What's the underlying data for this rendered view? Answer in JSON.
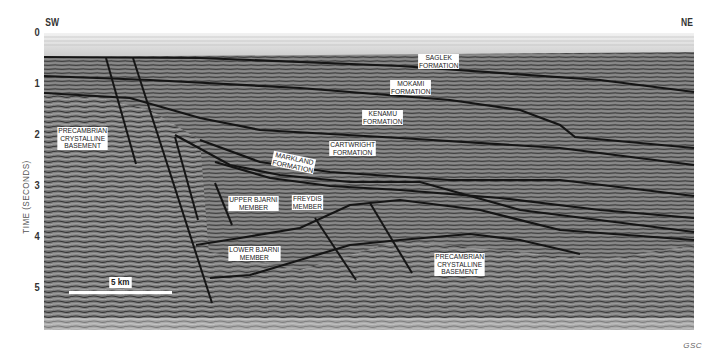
{
  "figure": {
    "type": "seismic reflection profile",
    "orientation": {
      "left": "SW",
      "right": "NE"
    },
    "credit": "GSC"
  },
  "axis": {
    "title": "TIME  (SECONDS)",
    "ticks": [
      "0",
      "1",
      "2",
      "3",
      "4",
      "5"
    ]
  },
  "scale_bar": {
    "label": "5 km"
  },
  "labels": {
    "saglek": [
      "SAGLEK",
      "FORMATION"
    ],
    "mokami": [
      "MOKAMI",
      "FORMATION"
    ],
    "kenamu": [
      "KENAMU",
      "FORMATION"
    ],
    "cartwright": [
      "CARTWRIGHT",
      "FORMATION"
    ],
    "markland": [
      "MARKLAND",
      "FORMATION"
    ],
    "upper_bjarni": [
      "UPPER BJARNI",
      "MEMBER"
    ],
    "freydis": [
      "FREYDIS",
      "MEMBER"
    ],
    "lower_bjarni": [
      "LOWER BJARNI",
      "MEMBER"
    ],
    "basement_west": [
      "PRECAMBRIAN",
      "CRYSTALLINE",
      "BASEMENT"
    ],
    "basement_east": [
      "PRECAMBRIAN",
      "CRYSTALLINE",
      "BASEMENT"
    ]
  },
  "colors": {
    "water": "#d8d8d8",
    "section": "#6f6f6f",
    "horizon": "#1a1a1a",
    "label_bg": "#ffffff"
  }
}
